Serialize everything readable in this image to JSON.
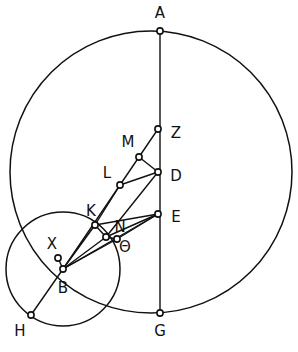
{
  "figure": {
    "canvas": {
      "width": 298,
      "height": 352
    },
    "stroke_color": "#111111",
    "fill_color": "#ffffff",
    "background": "#ffffff"
  },
  "circles": [
    {
      "name": "large-circle",
      "cx": 151,
      "cy": 172,
      "r": 141
    },
    {
      "name": "small-circle",
      "cx": 63,
      "cy": 269,
      "r": 57
    }
  ],
  "points": [
    {
      "id": "A",
      "x": 160,
      "y": 31,
      "label": "A",
      "lx": 160,
      "ly": 13
    },
    {
      "id": "Z",
      "x": 158,
      "y": 129,
      "label": "Z",
      "lx": 176,
      "ly": 133
    },
    {
      "id": "M",
      "x": 139,
      "y": 157,
      "label": "M",
      "lx": 128,
      "ly": 142
    },
    {
      "id": "D",
      "x": 158,
      "y": 172,
      "label": "D",
      "lx": 176,
      "ly": 176
    },
    {
      "id": "L",
      "x": 120,
      "y": 185,
      "label": "L",
      "lx": 107,
      "ly": 173
    },
    {
      "id": "E",
      "x": 158,
      "y": 214,
      "label": "E",
      "lx": 176,
      "ly": 217
    },
    {
      "id": "K",
      "x": 95,
      "y": 225,
      "label": "K",
      "lx": 91,
      "ly": 211
    },
    {
      "id": "N",
      "x": 106,
      "y": 237,
      "label": "N",
      "lx": 120,
      "ly": 227
    },
    {
      "id": "TH",
      "x": 117,
      "y": 239,
      "label": "Θ",
      "lx": 125,
      "ly": 247
    },
    {
      "id": "X",
      "x": 58,
      "y": 258,
      "label": "X",
      "lx": 52,
      "ly": 244
    },
    {
      "id": "B",
      "x": 63,
      "y": 269,
      "label": "B",
      "lx": 63,
      "ly": 288
    },
    {
      "id": "G",
      "x": 160,
      "y": 313,
      "label": "G",
      "lx": 160,
      "ly": 331
    },
    {
      "id": "H",
      "x": 31,
      "y": 315,
      "label": "H",
      "lx": 20,
      "ly": 331
    }
  ],
  "segments": [
    {
      "name": "A-G-diameter",
      "from": "A",
      "to": "G"
    },
    {
      "name": "Z-M",
      "from": "Z",
      "to": "M"
    },
    {
      "name": "M-D",
      "from": "M",
      "to": "D"
    },
    {
      "name": "M-L",
      "from": "M",
      "to": "L"
    },
    {
      "name": "L-D",
      "from": "L",
      "to": "D"
    },
    {
      "name": "L-K",
      "from": "L",
      "to": "K"
    },
    {
      "name": "K-E",
      "from": "K",
      "to": "E"
    },
    {
      "name": "D-N",
      "from": "D",
      "to": "N"
    },
    {
      "name": "E-N",
      "from": "E",
      "to": "N"
    },
    {
      "name": "E-TH",
      "from": "E",
      "to": "TH"
    },
    {
      "name": "K-N",
      "from": "K",
      "to": "N"
    },
    {
      "name": "N-TH",
      "from": "N",
      "to": "TH"
    },
    {
      "name": "B-X",
      "from": "B",
      "to": "X"
    },
    {
      "name": "B-K",
      "from": "B",
      "to": "K"
    },
    {
      "name": "B-L",
      "from": "B",
      "to": "L"
    },
    {
      "name": "B-N",
      "from": "B",
      "to": "N"
    },
    {
      "name": "B-TH",
      "from": "B",
      "to": "TH"
    },
    {
      "name": "B-E",
      "from": "B",
      "to": "E"
    },
    {
      "name": "B-H",
      "from": "B",
      "to": "H"
    }
  ],
  "labels_list": [
    "A",
    "Z",
    "M",
    "D",
    "L",
    "E",
    "K",
    "N",
    "Θ",
    "X",
    "B",
    "G",
    "H"
  ]
}
